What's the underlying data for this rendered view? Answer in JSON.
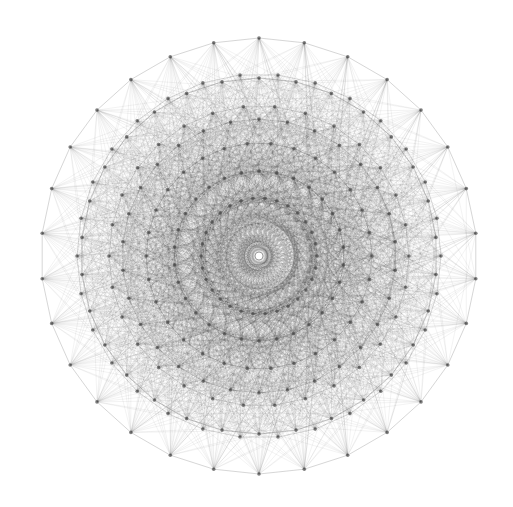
{
  "diagram": {
    "type": "polytope-petrie-projection",
    "symmetry_order": 30,
    "center": [
      259,
      256
    ],
    "background": "#ffffff",
    "line_color": "#3a3a3a",
    "vertex_color": "#4a4a4a",
    "center_hole_color": "#ffffff",
    "rings": [
      {
        "radius": 218,
        "offset_deg": 6,
        "count": 30
      },
      {
        "radius": 182,
        "offset_deg": 0,
        "count": 30
      },
      {
        "radius": 178,
        "offset_deg": 6,
        "count": 30
      },
      {
        "radius": 150,
        "offset_deg": 0,
        "count": 30
      },
      {
        "radius": 137,
        "offset_deg": 6,
        "count": 30
      },
      {
        "radius": 113,
        "offset_deg": 0,
        "count": 30
      },
      {
        "radius": 85,
        "offset_deg": 6,
        "count": 30
      },
      {
        "radius": 58,
        "offset_deg": 0,
        "count": 30
      }
    ]
  }
}
